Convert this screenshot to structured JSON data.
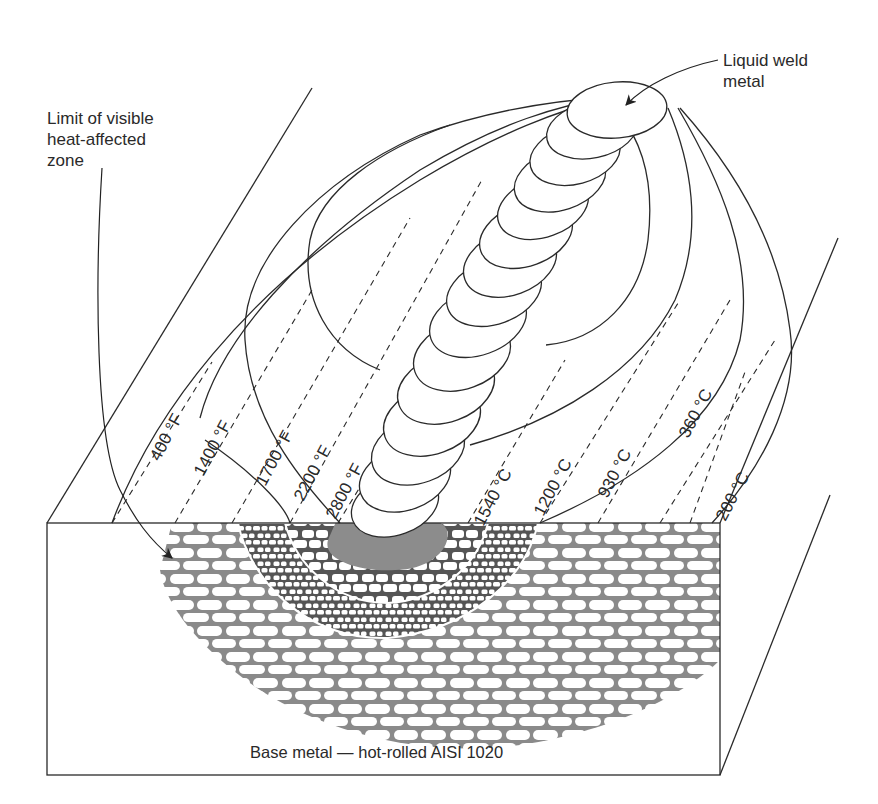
{
  "diagram": {
    "callouts": {
      "haz_limit": "Limit of visible\nheat-affected\nzone",
      "liquid_weld": "Liquid weld\nmetal",
      "base_metal": "Base metal — hot-rolled AISI 1020"
    },
    "isotherms_fahrenheit": [
      {
        "label": "400 °F"
      },
      {
        "label": "1400 °F"
      },
      {
        "label": "1700 °F"
      },
      {
        "label": "2200 °F"
      },
      {
        "label": "2800 °F"
      }
    ],
    "isotherms_celsius": [
      {
        "label": "1540 °C"
      },
      {
        "label": "1200 °C"
      },
      {
        "label": "930 °C"
      },
      {
        "label": "360 °C"
      },
      {
        "label": "200 °C"
      }
    ],
    "colors": {
      "line": "#2a2a2a",
      "weld_pool": "#8c8c8c",
      "grain_boundary": "#8a8a8a",
      "grain_fill": "#ffffff",
      "dark_grain": "#8c8c8c"
    }
  }
}
